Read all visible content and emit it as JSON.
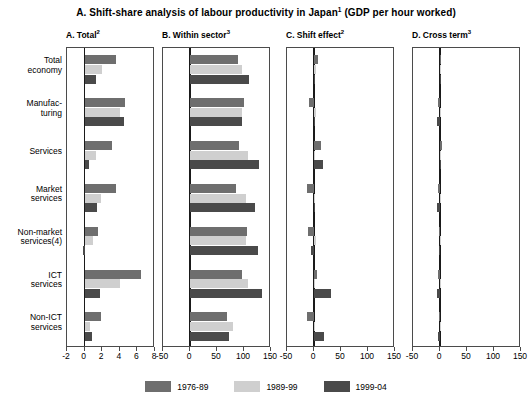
{
  "figure": {
    "title_main": "A. Shift-share analysis of labour productivity in Japan",
    "title_sup1": "1",
    "title_tail": " (GDP per hour worked)"
  },
  "categories": [
    {
      "line1": "Total",
      "line2": "economy"
    },
    {
      "line1": "Manufac-",
      "line2": "turing"
    },
    {
      "line1": "Services",
      "line2": ""
    },
    {
      "line1": "Market",
      "line2": "services"
    },
    {
      "line1": "Non-market",
      "line2": "services(4)"
    },
    {
      "line1": "ICT",
      "line2": "services"
    },
    {
      "line1": "Non-ICT",
      "line2": "services"
    }
  ],
  "legend": [
    {
      "label": "1976-89",
      "color": "#6e6e6e"
    },
    {
      "label": "1989-99",
      "color": "#cfcfcf"
    },
    {
      "label": "1999-04",
      "color": "#4a4a4a"
    }
  ],
  "chart_data": [
    {
      "type": "bar",
      "panel": "A",
      "title": "A. Total",
      "title_sup": "2",
      "orientation": "horizontal",
      "grid": false,
      "legend_position": "bottom",
      "xlabel": "",
      "ylabel": "",
      "xlim": [
        -2,
        8
      ],
      "ticks": [
        -2,
        0,
        2,
        4,
        6,
        8
      ],
      "tick_labels": [
        "-2",
        "0",
        "2",
        "4",
        "6",
        "8"
      ],
      "categories": [
        "Total economy",
        "Manufacturing",
        "Services",
        "Market services",
        "Non-market services(4)",
        "ICT services",
        "Non-ICT services"
      ],
      "series": [
        {
          "name": "1976-89",
          "values": [
            3.6,
            4.6,
            3.1,
            3.6,
            1.5,
            6.4,
            1.9
          ]
        },
        {
          "name": "1989-99",
          "values": [
            2.0,
            4.0,
            1.3,
            1.9,
            0.9,
            4.0,
            0.6
          ]
        },
        {
          "name": "1999-04",
          "values": [
            1.3,
            4.5,
            0.5,
            1.4,
            -0.2,
            1.7,
            0.8
          ]
        }
      ]
    },
    {
      "type": "bar",
      "panel": "B",
      "title": "B. Within sector",
      "title_sup": "3",
      "orientation": "horizontal",
      "grid": false,
      "legend_position": "bottom",
      "xlabel": "",
      "ylabel": "",
      "xlim": [
        -50,
        150
      ],
      "ticks": [
        -50,
        0,
        50,
        100,
        150
      ],
      "tick_labels": [
        "-50",
        "0",
        "50",
        "100",
        "150"
      ],
      "categories": [
        "Total economy",
        "Manufacturing",
        "Services",
        "Market services",
        "Non-market services(4)",
        "ICT services",
        "Non-ICT services"
      ],
      "series": [
        {
          "name": "1976-89",
          "values": [
            88,
            100,
            90,
            85,
            106,
            96,
            68
          ]
        },
        {
          "name": "1989-99",
          "values": [
            96,
            96,
            108,
            104,
            104,
            107,
            80
          ]
        },
        {
          "name": "1999-04",
          "values": [
            110,
            97,
            127,
            121,
            126,
            133,
            72
          ]
        }
      ]
    },
    {
      "type": "bar",
      "panel": "C",
      "title": "C. Shift effect",
      "title_sup": "2",
      "orientation": "horizontal",
      "grid": false,
      "legend_position": "bottom",
      "xlabel": "",
      "ylabel": "",
      "xlim": [
        -50,
        150
      ],
      "ticks": [
        -50,
        0,
        50,
        100,
        150
      ],
      "tick_labels": [
        "-50",
        "0",
        "50",
        "100",
        "150"
      ],
      "categories": [
        "Total economy",
        "Manufacturing",
        "Services",
        "Market services",
        "Non-market services(4)",
        "ICT services",
        "Non-ICT services"
      ],
      "series": [
        {
          "name": "1976-89",
          "values": [
            8,
            -9,
            13,
            -13,
            -11,
            6,
            -13
          ]
        },
        {
          "name": "1989-99",
          "values": [
            3,
            4,
            0,
            0,
            3,
            0,
            0
          ]
        },
        {
          "name": "1999-04",
          "values": [
            0,
            2,
            17,
            0,
            -6,
            32,
            18
          ]
        }
      ]
    },
    {
      "type": "bar",
      "panel": "D",
      "title": "D. Cross term",
      "title_sup": "3",
      "orientation": "horizontal",
      "grid": false,
      "legend_position": "bottom",
      "xlabel": "",
      "ylabel": "",
      "xlim": [
        -50,
        150
      ],
      "ticks": [
        -50,
        0,
        50,
        100,
        150
      ],
      "tick_labels": [
        "-50",
        "0",
        "50",
        "100",
        "150"
      ],
      "categories": [
        "Total economy",
        "Manufacturing",
        "Services",
        "Market services",
        "Non-market services(4)",
        "ICT services",
        "Non-ICT services"
      ],
      "series": [
        {
          "name": "1976-89",
          "values": [
            2,
            -4,
            4,
            -4,
            -2,
            -4,
            -2
          ]
        },
        {
          "name": "1989-99",
          "values": [
            1,
            0,
            0,
            2,
            2,
            2,
            0
          ]
        },
        {
          "name": "1999-04",
          "values": [
            0,
            -5,
            0,
            -5,
            -2,
            -5,
            -3
          ]
        }
      ]
    }
  ],
  "panel_layout": [
    {
      "left": 66,
      "width": 88
    },
    {
      "left": 162,
      "width": 108
    },
    {
      "left": 286,
      "width": 108
    },
    {
      "left": 412,
      "width": 108
    }
  ]
}
